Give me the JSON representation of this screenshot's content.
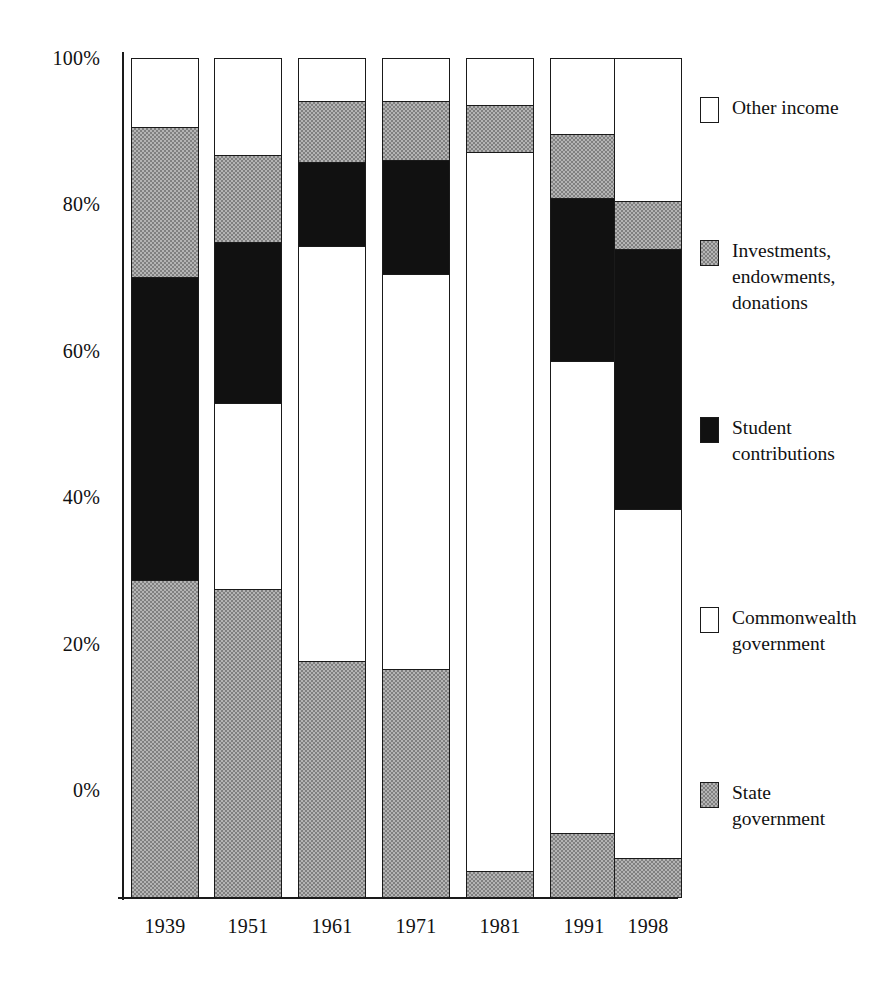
{
  "chart_data": {
    "type": "bar",
    "subtype": "stacked-percentage-column",
    "title": "",
    "subtitle": "",
    "xlabel": "",
    "ylabel": "",
    "categories": [
      "1939",
      "1951",
      "1961",
      "1971",
      "1981",
      "1991",
      "1998"
    ],
    "ylim": [
      0,
      100
    ],
    "ytick_labels": [
      "0%",
      "20%",
      "40%",
      "60%",
      "80%",
      "100%"
    ],
    "ytick_values": [
      0,
      20,
      40,
      60,
      80,
      100
    ],
    "grid": false,
    "legend_position": "right",
    "stack_order_top_to_bottom": [
      "Other income",
      "Investments, endowments, donations",
      "Student contributions",
      "Commonwealth government",
      "State government"
    ],
    "series": [
      {
        "name": "Other income",
        "key": "other_income",
        "fill": "white",
        "values": [
          8.2,
          11.5,
          5.0,
          5.0,
          5.5,
          9.0,
          17.0
        ]
      },
      {
        "name": "Investments, endowments, donations",
        "key": "investments",
        "fill": "hatch-gray",
        "values": [
          17.8,
          10.3,
          7.2,
          7.0,
          5.5,
          7.5,
          5.7
        ]
      },
      {
        "name": "Student contributions",
        "key": "student_contributions",
        "fill": "black",
        "values": [
          36.2,
          19.2,
          10.0,
          13.5,
          0.0,
          19.5,
          31.0
        ]
      },
      {
        "name": "Commonwealth government",
        "key": "commonwealth_government",
        "fill": "white",
        "values": [
          0.0,
          22.2,
          49.6,
          47.3,
          86.0,
          56.5,
          41.8
        ]
      },
      {
        "name": "State government",
        "key": "state_government",
        "fill": "hatch-gray",
        "values": [
          37.8,
          36.8,
          28.2,
          27.2,
          3.0,
          7.5,
          4.5
        ]
      }
    ]
  },
  "axis": {
    "y_ticks": [
      {
        "label": "100%",
        "value": 100
      },
      {
        "label": "80%",
        "value": 80
      },
      {
        "label": "60%",
        "value": 60
      },
      {
        "label": "40%",
        "value": 40
      },
      {
        "label": "20%",
        "value": 20
      },
      {
        "label": "0%",
        "value": 0
      }
    ]
  },
  "legend": {
    "items": [
      {
        "label": "Other income",
        "swatch": "white-swatch-icon",
        "fill": "white"
      },
      {
        "label": "Investments,\nendowments,\ndonations",
        "swatch": "hatch-swatch-icon",
        "fill": "hatch-gray"
      },
      {
        "label": "Student\ncontributions",
        "swatch": "black-swatch-icon",
        "fill": "black"
      },
      {
        "label": "Commonwealth\ngovernment",
        "swatch": "white-swatch-icon",
        "fill": "white"
      },
      {
        "label": "State\ngovernment",
        "swatch": "hatch-swatch-icon",
        "fill": "hatch-gray"
      }
    ]
  },
  "colors": {
    "ink": "#111111",
    "black_fill": "#111111",
    "white_fill": "#ffffff",
    "hatch_light": "#b4b4b4",
    "hatch_dark": "#808080"
  }
}
